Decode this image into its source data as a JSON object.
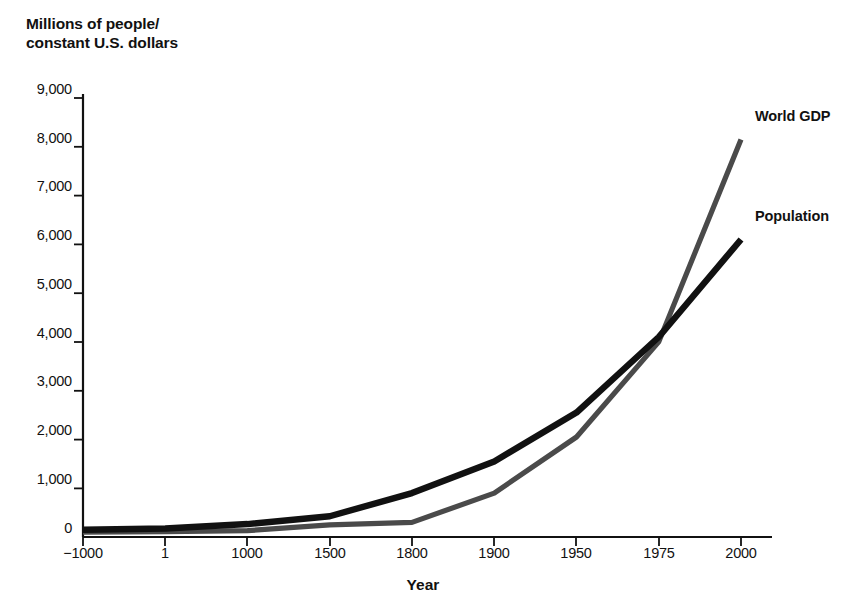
{
  "chart_data": {
    "type": "line",
    "title": "",
    "ylabel": "Millions of people/\nconstant U.S. dollars",
    "xlabel": "Year",
    "categories": [
      "−1000",
      "1",
      "1000",
      "1500",
      "1800",
      "1900",
      "1950",
      "1975",
      "2000"
    ],
    "x_numeric": [
      -1000,
      1,
      1000,
      1500,
      1800,
      1900,
      1950,
      1975,
      2000
    ],
    "yticks": [
      "0",
      "1,000",
      "2,000",
      "3,000",
      "4,000",
      "5,000",
      "6,000",
      "7,000",
      "8,000",
      "9,000"
    ],
    "ytick_values": [
      0,
      1000,
      2000,
      3000,
      4000,
      5000,
      6000,
      7000,
      8000,
      9000
    ],
    "ylim": [
      0,
      9000
    ],
    "grid": false,
    "legend_position": "right-inline-annotations",
    "series": [
      {
        "name": "World GDP",
        "color": "#4a4a4a",
        "values": [
          100,
          110,
          130,
          250,
          300,
          900,
          2050,
          4000,
          8150
        ]
      },
      {
        "name": "Population",
        "color": "#111111",
        "values": [
          150,
          175,
          265,
          425,
          900,
          1550,
          2550,
          4100,
          6100
        ]
      }
    ],
    "annotations": [
      {
        "text": "World GDP",
        "series": "World GDP"
      },
      {
        "text": "Population",
        "series": "Population"
      }
    ]
  },
  "axes": {
    "y_title": "Millions of people/\nconstant U.S. dollars",
    "x_title": "Year"
  },
  "labels": {
    "series_gdp": "World GDP",
    "series_population": "Population"
  }
}
